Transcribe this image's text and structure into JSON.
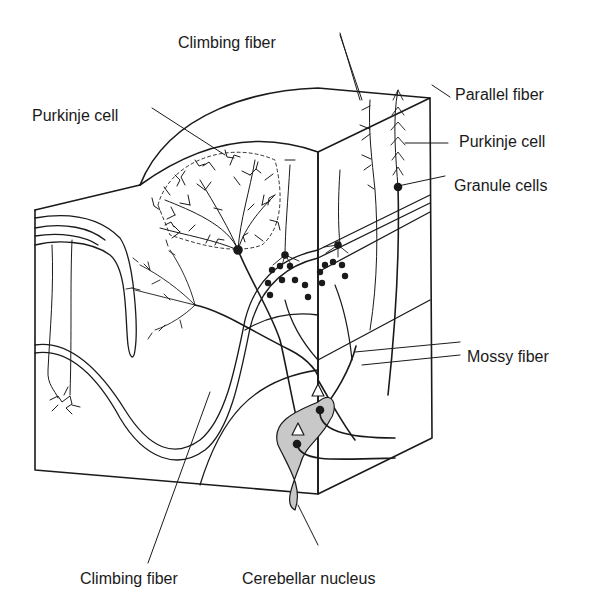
{
  "diagram": {
    "colors": {
      "line": "#1a1a1a",
      "nucleus_fill": "#c8c8c8",
      "background": "#ffffff"
    },
    "labels": {
      "climbing_fiber_top": "Climbing fiber",
      "parallel_fiber": "Parallel fiber",
      "purkinje_cell_left": "Purkinje cell",
      "purkinje_cell_right": "Purkinje cell",
      "granule_cells": "Granule cells",
      "mossy_fiber": "Mossy fiber",
      "climbing_fiber_bottom": "Climbing fiber",
      "cerebellar_nucleus": "Cerebellar nucleus"
    }
  }
}
